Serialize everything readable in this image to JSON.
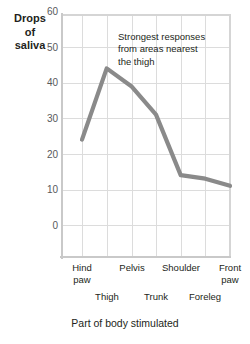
{
  "chart_data": {
    "type": "line",
    "title": "",
    "ylabel": "Drops of saliva",
    "ylabel_lines": [
      "Drops",
      "of",
      "saliva"
    ],
    "xlabel": "Part of body stimulated",
    "categories": [
      "Hind paw",
      "Thigh",
      "Pelvis",
      "Trunk",
      "Shoulder",
      "Foreleg",
      "Front paw"
    ],
    "values": [
      33,
      53,
      48,
      40,
      23,
      22,
      20
    ],
    "ylim": [
      0,
      68
    ],
    "yticks": [
      0,
      10,
      20,
      30,
      40,
      50,
      60
    ],
    "ytick_labels": [
      "0",
      "10",
      "20",
      "30",
      "40",
      "50",
      "60"
    ],
    "grid": true,
    "legend": "none",
    "series": [
      {
        "name": "Drops of saliva",
        "values": [
          33,
          53,
          48,
          40,
          23,
          22,
          20
        ],
        "color": "#8a8a8a"
      }
    ],
    "annotations": [
      {
        "text": "Strongest responses from areas nearest the thigh",
        "lines": [
          "Strongest responses",
          "from areas nearest",
          "the thigh"
        ]
      }
    ]
  },
  "axis": {
    "x_tick_labels_top": [
      {
        "lines": [
          "Hind",
          "paw"
        ]
      },
      {
        "lines": [
          "Pelvis"
        ]
      },
      {
        "lines": [
          "Shoulder"
        ]
      },
      {
        "lines": [
          "Front",
          "paw"
        ]
      }
    ],
    "x_tick_labels_bottom": [
      {
        "lines": [
          "Thigh"
        ]
      },
      {
        "lines": [
          "Trunk"
        ]
      },
      {
        "lines": [
          "Foreleg"
        ]
      }
    ]
  },
  "colors": {
    "line": "#8a8a8a",
    "gridline": "#dcdcdc",
    "axis": "#c9c9c9",
    "text": "#231f20",
    "tick_text": "#58595b",
    "background": "#ffffff"
  }
}
